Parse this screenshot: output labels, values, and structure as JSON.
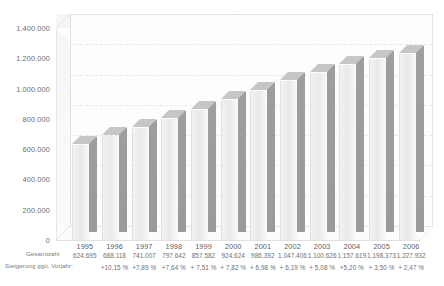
{
  "chart_data": {
    "type": "bar",
    "title": "",
    "subtitle": "",
    "xlabel": "",
    "ylabel": "",
    "categories": [
      "1995",
      "1996",
      "1997",
      "1998",
      "1999",
      "2000",
      "2001",
      "2002",
      "2003",
      "2004",
      "2005",
      "2006"
    ],
    "values": [
      624695,
      688118,
      741007,
      797642,
      857582,
      924624,
      986392,
      1047406,
      1100626,
      1157619,
      1198373,
      1227932
    ],
    "value_labels": [
      "624.695",
      "688.118",
      "741.007",
      "797.642",
      "857.582",
      "924.624",
      "986.392",
      "1.047.406",
      "1.100.626",
      "1.157.619",
      "1.198.373",
      "1.227.932"
    ],
    "growth_labels": [
      "+10,15 %",
      "+7,89 %",
      "+7,64 %",
      "+ 7,51 %",
      "+ 7,82 %",
      "+ 6,98 %",
      "+ 6,19 %",
      "+ 5,08 %",
      "+5,20 %",
      "+ 3,50 %",
      "+ 2,47 %"
    ],
    "ylim": [
      0,
      1400000
    ],
    "yticks": [
      0,
      200000,
      400000,
      600000,
      800000,
      1000000,
      1200000,
      1400000
    ],
    "ytick_labels": [
      "0",
      "200.000",
      "400.000",
      "600.000",
      "800.000",
      "1.000.000",
      "1.200.000",
      "1.400.000"
    ],
    "grid": true,
    "grid_style": "dashed-horizontal",
    "legend": "none",
    "series": [
      {
        "name": "Gesamtzahl",
        "values": [
          624695,
          688118,
          741007,
          797642,
          857582,
          924624,
          986392,
          1047406,
          1100626,
          1157619,
          1198373,
          1227932
        ]
      }
    ],
    "colors": {
      "bar_front": "#eeeeee",
      "bar_side": "#9c9c9c",
      "bar_top": "#c9c9c9",
      "gridline": "#e8e8e8",
      "axis": "#e0e0e0",
      "text": "#6f6f6f",
      "background": "#ffffff"
    }
  },
  "table": {
    "row_labels": {
      "total": "Gesamtzahl",
      "growth": "Steigerung ggü. Vorjahr:"
    },
    "header": [
      "1995",
      "1996",
      "1997",
      "1998",
      "1999",
      "2000",
      "2001",
      "2002",
      "2003",
      "2004",
      "2005",
      "2006"
    ],
    "rows": {
      "total": [
        "624.695",
        "688.118",
        "741.007",
        "797.642",
        "857.582",
        "924.624",
        "986.392",
        "1.047.406",
        "1.100.626",
        "1.157.619",
        "1.198.373",
        "1.227.932"
      ],
      "growth": [
        "",
        "+10,15 %",
        "+7,89 %",
        "+7,64 %",
        "+ 7,51 %",
        "+ 7,82 %",
        "+ 6,98 %",
        "+ 6,19 %",
        "+ 5,08 %",
        "+5,20 %",
        "+ 3,50 %",
        "+ 2,47 %"
      ]
    }
  }
}
